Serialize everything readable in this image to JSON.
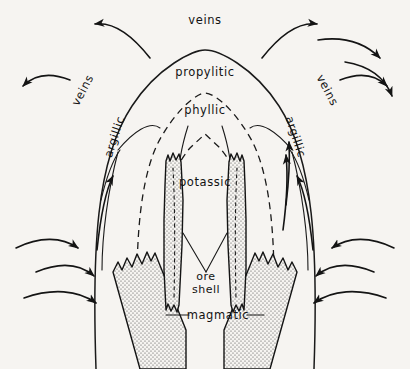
{
  "figure": {
    "background_color": "#f6f4f1",
    "ink_color": "#141414",
    "stipple_color": "#4a4a4a",
    "type": "geologic-cross-section"
  },
  "labels": {
    "veins_top": "veins",
    "veins_left": "veins",
    "veins_right": "veins",
    "propylitic": "propylitic",
    "phyllic": "phyllic",
    "argillic_left": "argillic",
    "argillic_right": "argillic",
    "potassic": "potassic",
    "ore_shell_line1": "ore",
    "ore_shell_line2": "shell",
    "magmatic": "magmatic"
  },
  "zones": [
    {
      "name": "propylitic",
      "boundary": "solid-arc",
      "position": "outermost"
    },
    {
      "name": "phyllic",
      "boundary": "dashed-arc",
      "position": "middle"
    },
    {
      "name": "argillic",
      "boundary": "solid-arc",
      "position": "flank"
    },
    {
      "name": "potassic",
      "boundary": "dashed-peaked-arc",
      "position": "core"
    }
  ],
  "features": [
    {
      "name": "ore-shell-left",
      "pattern": "stippled",
      "shape": "narrow-vertical-band"
    },
    {
      "name": "ore-shell-right",
      "pattern": "stippled",
      "shape": "narrow-vertical-band"
    },
    {
      "name": "magmatic-left",
      "pattern": "stippled",
      "shape": "wide-inclined-band"
    },
    {
      "name": "magmatic-right",
      "pattern": "stippled",
      "shape": "wide-inclined-band"
    }
  ],
  "flow_arrows": {
    "upper_left_outward": 2,
    "upper_right_outward": 2,
    "lower_left_inward": 3,
    "lower_right_inward": 3,
    "interior_upward": 4
  }
}
